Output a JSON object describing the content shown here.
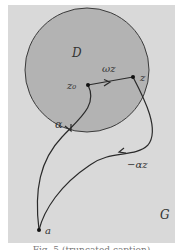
{
  "diagram": {
    "region_outer_label": "G",
    "disk_label": "D",
    "points": {
      "center": "z₀",
      "z": "z",
      "a": "a"
    },
    "paths": {
      "alpha": "α",
      "omega_z": "ωz",
      "minus_alpha_z": "−αz"
    },
    "colors": {
      "outer_region": "#d9d9d9",
      "disk": "#b3b3b3",
      "stroke": "#2a2a2a",
      "background": "#ffffff"
    }
  },
  "caption": {
    "text": "Fig. 5 (truncated caption)"
  }
}
